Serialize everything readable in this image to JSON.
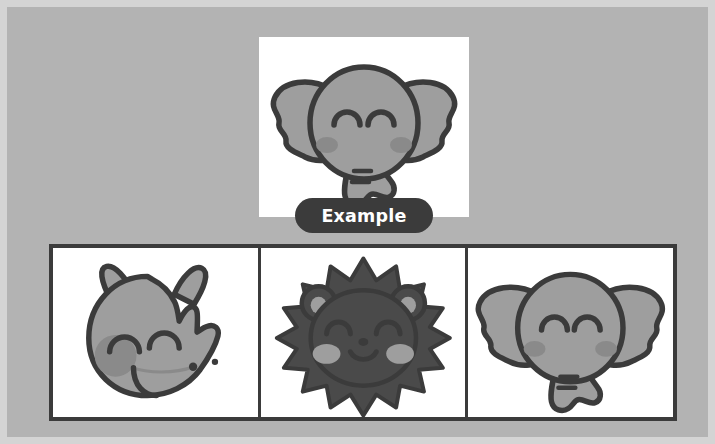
{
  "page": {
    "type": "visual-matching-exercise",
    "background_color": "#b3b3b3",
    "frame_color": "#d4d4d4",
    "ink_color": "#3b3b3b",
    "card_color": "#ffffff",
    "animal_fill": "#9e9e9e",
    "animal_shade": "#8a8a8a",
    "blush_color": "#a8a8a8"
  },
  "example": {
    "label": "Example",
    "pill_bg": "#3b3b3b",
    "pill_text_color": "#ffffff",
    "icon": "elephant-face-icon",
    "animal": "elephant"
  },
  "options": [
    {
      "index": 1,
      "icon": "rhino-face-icon",
      "animal": "rhinoceros",
      "fill": "#9e9e9e",
      "selected": false
    },
    {
      "index": 2,
      "icon": "lion-face-icon",
      "animal": "lion",
      "fill": "#4a4a4a",
      "selected": false
    },
    {
      "index": 3,
      "icon": "elephant-face-icon",
      "animal": "elephant",
      "fill": "#9e9e9e",
      "selected": false
    }
  ]
}
